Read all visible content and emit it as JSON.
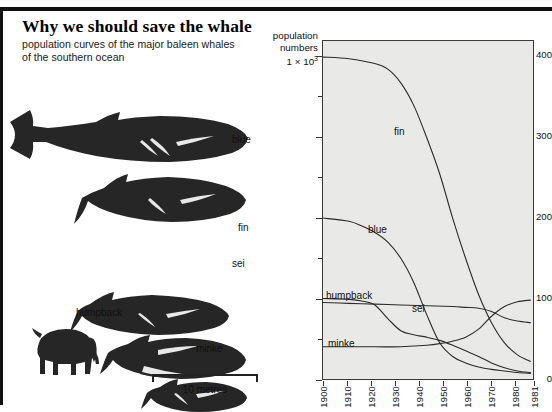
{
  "headline": {
    "title": "Why we should save the whale",
    "subtitle": "population curves of the major baleen whales\nof the southern ocean"
  },
  "illustration": {
    "name": "whale-size-comparison",
    "species_labels": [
      {
        "name": "blue",
        "label": "blue"
      },
      {
        "name": "fin",
        "label": "fin"
      },
      {
        "name": "sei",
        "label": "sei"
      },
      {
        "name": "humpback",
        "label": "humpback"
      },
      {
        "name": "minke",
        "label": "minke"
      }
    ],
    "reference_animal": "elephant",
    "scale_bar": {
      "label": "10 metres",
      "length_metres": 10
    }
  },
  "chart_data": {
    "type": "line",
    "title": "",
    "ylabel": "population numbers 1 x 10^3",
    "ylabel_lines": [
      "population",
      "numbers",
      "1 × 10"
    ],
    "ylabel_exponent": "3",
    "xlabel": "",
    "xlim": [
      1900,
      1981
    ],
    "ylim": [
      0,
      420
    ],
    "yticks_major": [
      0,
      100,
      200,
      300,
      400
    ],
    "yticks_minor": [
      50,
      150,
      250,
      350
    ],
    "xticks": [
      "1900",
      "1910",
      "1920",
      "1930",
      "1940",
      "1950",
      "1960",
      "1970",
      "1980",
      "1981"
    ],
    "grid": false,
    "legend": "inline-labels",
    "plot_background": "#e9e9e7",
    "line_color": "#2b2b2b",
    "series": [
      {
        "name": "fin",
        "label": "fin",
        "x": [
          1900,
          1910,
          1920,
          1925,
          1930,
          1935,
          1940,
          1945,
          1950,
          1955,
          1960,
          1965,
          1970,
          1975,
          1980
        ],
        "values": [
          400,
          398,
          392,
          385,
          368,
          340,
          300,
          255,
          200,
          150,
          105,
          70,
          45,
          30,
          22
        ]
      },
      {
        "name": "blue",
        "label": "blue",
        "x": [
          1900,
          1910,
          1915,
          1920,
          1925,
          1930,
          1935,
          1940,
          1945,
          1950,
          1955,
          1960,
          1965,
          1970,
          1975,
          1980
        ],
        "values": [
          200,
          196,
          190,
          182,
          170,
          150,
          120,
          80,
          45,
          28,
          20,
          15,
          12,
          10,
          8,
          7
        ]
      },
      {
        "name": "humpback",
        "label": "humpback",
        "x": [
          1900,
          1910,
          1915,
          1920,
          1925,
          1930,
          1935,
          1940,
          1945,
          1950,
          1955,
          1960,
          1965,
          1970,
          1975,
          1980
        ],
        "values": [
          100,
          99,
          97,
          92,
          75,
          60,
          55,
          52,
          48,
          42,
          35,
          28,
          20,
          14,
          10,
          8
        ]
      },
      {
        "name": "sei",
        "label": "sei",
        "x": [
          1900,
          1910,
          1920,
          1930,
          1940,
          1950,
          1955,
          1960,
          1965,
          1970,
          1975,
          1980
        ],
        "values": [
          95,
          94,
          93,
          92,
          91,
          90,
          89,
          88,
          84,
          76,
          72,
          70
        ]
      },
      {
        "name": "minke",
        "label": "minke",
        "x": [
          1900,
          1910,
          1920,
          1930,
          1935,
          1940,
          1945,
          1950,
          1955,
          1960,
          1965,
          1970,
          1975,
          1980
        ],
        "values": [
          40,
          40,
          40,
          40,
          41,
          42,
          44,
          47,
          52,
          62,
          78,
          90,
          96,
          98
        ]
      }
    ]
  }
}
